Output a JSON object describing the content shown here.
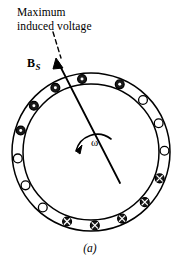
{
  "figure": {
    "caption": "(a)",
    "annotations": {
      "max_voltage_label": "Maximum\ninduced voltage",
      "field_label": "B",
      "field_subscript": "S",
      "rotation_label": "ω"
    },
    "colors": {
      "stroke": "#000000",
      "fill_conductor": "#1a1a1a",
      "background": "#ffffff",
      "hollow_fill": "#ffffff"
    }
  },
  "diagram_data": {
    "type": "machine-cross-section",
    "description": "Annular stator ring with conductor slots; filled markers denote current out of page, hollow markers denote empty or opposite-phase slots.",
    "ring": {
      "center_x": 91,
      "center_y": 152,
      "outer_radius": 79,
      "inner_radius": 68,
      "slot_radius": 73.5,
      "conductor_marker_radius": 4.4
    },
    "field_arrow": {
      "tail_x": 120,
      "tail_y": 183,
      "tip_x": 56,
      "tip_y": 59,
      "label": "B_S"
    },
    "leader_line": {
      "dashed": true,
      "start_x": 53,
      "start_y": 33,
      "end_x": 60,
      "end_y": 58
    },
    "rotation_arrow": {
      "direction": "counterclockwise",
      "label": "ω",
      "arc_center_x": 91,
      "arc_center_y": 152,
      "arc_radius": 22
    },
    "conductors": [
      {
        "index": 0,
        "angle_deg": 97,
        "state": "out"
      },
      {
        "index": 1,
        "angle_deg": 119,
        "state": "out"
      },
      {
        "index": 2,
        "angle_deg": 141,
        "state": "out"
      },
      {
        "index": 3,
        "angle_deg": 163,
        "state": "out"
      },
      {
        "index": 4,
        "angle_deg": 185,
        "state": "empty"
      },
      {
        "index": 5,
        "angle_deg": 207,
        "state": "empty"
      },
      {
        "index": 6,
        "angle_deg": 229,
        "state": "empty"
      },
      {
        "index": 7,
        "angle_deg": 251,
        "state": "in"
      },
      {
        "index": 8,
        "angle_deg": 273,
        "state": "in"
      },
      {
        "index": 9,
        "angle_deg": 295,
        "state": "in"
      },
      {
        "index": 10,
        "angle_deg": 317,
        "state": "in"
      },
      {
        "index": 11,
        "angle_deg": 339,
        "state": "in"
      },
      {
        "index": 12,
        "angle_deg": 1,
        "state": "empty"
      },
      {
        "index": 13,
        "angle_deg": 23,
        "state": "empty"
      },
      {
        "index": 14,
        "angle_deg": 45,
        "state": "empty"
      },
      {
        "index": 15,
        "angle_deg": 67,
        "state": "out"
      }
    ],
    "legend": {
      "out": "dot marker — current out of page",
      "in": "cross marker — current into page",
      "empty": "hollow circle — unoccupied slot"
    }
  }
}
